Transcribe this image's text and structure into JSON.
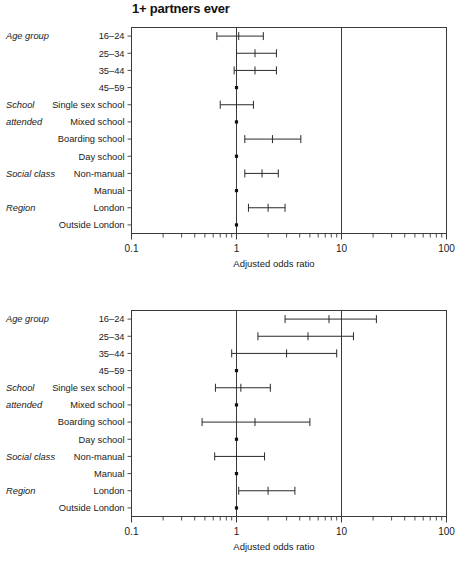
{
  "figure": {
    "axis_title": "Adjusted odds ratio",
    "row_labels": [
      "16–24",
      "25–34",
      "35–44",
      "45–59",
      "Single sex school",
      "Mixed school",
      "Boarding school",
      "Day school",
      "Non-manual",
      "Manual",
      "London",
      "Outside London"
    ],
    "group_labels": [
      {
        "text": "Age group",
        "row": 0
      },
      {
        "text": "School",
        "row": 4
      },
      {
        "text": "attended",
        "row": 5
      },
      {
        "text": "Social class",
        "row": 8
      },
      {
        "text": "Region",
        "row": 10
      }
    ],
    "x_tick_labels": [
      "0.1",
      "1",
      "10",
      "100"
    ],
    "x_tick_values": [
      0.1,
      1,
      10,
      100
    ],
    "reference_value": 10,
    "axis_min": 0.1,
    "axis_max": 100
  },
  "chart_data": [
    {
      "type": "scatter",
      "title": "1+ partners ever",
      "xlabel": "Adjusted odds ratio",
      "ylabel": "",
      "xscale": "log",
      "xlim": [
        0.1,
        100
      ],
      "grid": false,
      "legend": "none",
      "categories": [
        "16–24",
        "25–34",
        "35–44",
        "45–59",
        "Single sex school",
        "Mixed school",
        "Boarding school",
        "Day school",
        "Non-manual",
        "Manual",
        "London",
        "Outside London"
      ],
      "series": [
        {
          "name": "Adjusted odds ratio",
          "points": [
            {
              "category": "16–24",
              "value": 1.05,
              "low": 0.65,
              "high": 1.8,
              "reference": false
            },
            {
              "category": "25–34",
              "value": 1.5,
              "low": 1.0,
              "high": 2.4,
              "reference": false
            },
            {
              "category": "35–44",
              "value": 1.5,
              "low": 0.95,
              "high": 2.4,
              "reference": false
            },
            {
              "category": "45–59",
              "value": 1.0,
              "low": null,
              "high": null,
              "reference": true
            },
            {
              "category": "Single sex school",
              "value": 1.0,
              "low": 0.7,
              "high": 1.45,
              "reference": false
            },
            {
              "category": "Mixed school",
              "value": 1.0,
              "low": null,
              "high": null,
              "reference": true
            },
            {
              "category": "Boarding school",
              "value": 2.2,
              "low": 1.2,
              "high": 4.1,
              "reference": false
            },
            {
              "category": "Day school",
              "value": 1.0,
              "low": null,
              "high": null,
              "reference": true
            },
            {
              "category": "Non-manual",
              "value": 1.75,
              "low": 1.2,
              "high": 2.5,
              "reference": false
            },
            {
              "category": "Manual",
              "value": 1.0,
              "low": null,
              "high": null,
              "reference": true
            },
            {
              "category": "London",
              "value": 2.0,
              "low": 1.3,
              "high": 2.9,
              "reference": false
            },
            {
              "category": "Outside London",
              "value": 1.0,
              "low": null,
              "high": null,
              "reference": true
            }
          ]
        }
      ]
    },
    {
      "type": "scatter",
      "title": "1+ partners last 5 years",
      "xlabel": "Adjusted odds ratio",
      "ylabel": "",
      "xscale": "log",
      "xlim": [
        0.1,
        100
      ],
      "grid": false,
      "legend": "none",
      "categories": [
        "16–24",
        "25–34",
        "35–44",
        "45–59",
        "Single sex school",
        "Mixed school",
        "Boarding school",
        "Day school",
        "Non-manual",
        "Manual",
        "London",
        "Outside London"
      ],
      "series": [
        {
          "name": "Adjusted odds ratio",
          "points": [
            {
              "category": "16–24",
              "value": 7.6,
              "low": 2.9,
              "high": 21.5,
              "reference": false
            },
            {
              "category": "25–34",
              "value": 4.8,
              "low": 1.6,
              "high": 13.0,
              "reference": false
            },
            {
              "category": "35–44",
              "value": 3.0,
              "low": 0.9,
              "high": 9.0,
              "reference": false
            },
            {
              "category": "45–59",
              "value": 1.0,
              "low": null,
              "high": null,
              "reference": true
            },
            {
              "category": "Single sex school",
              "value": 1.1,
              "low": 0.63,
              "high": 2.1,
              "reference": false
            },
            {
              "category": "Mixed school",
              "value": 1.0,
              "low": null,
              "high": null,
              "reference": true
            },
            {
              "category": "Boarding school",
              "value": 1.5,
              "low": 0.47,
              "high": 5.0,
              "reference": false
            },
            {
              "category": "Day school",
              "value": 1.0,
              "low": null,
              "high": null,
              "reference": true
            },
            {
              "category": "Non-manual",
              "value": 1.0,
              "low": 0.62,
              "high": 1.85,
              "reference": false
            },
            {
              "category": "Manual",
              "value": 1.0,
              "low": null,
              "high": null,
              "reference": true
            },
            {
              "category": "London",
              "value": 2.0,
              "low": 1.05,
              "high": 3.6,
              "reference": false
            },
            {
              "category": "Outside London",
              "value": 1.0,
              "low": null,
              "high": null,
              "reference": true
            }
          ]
        }
      ]
    }
  ]
}
